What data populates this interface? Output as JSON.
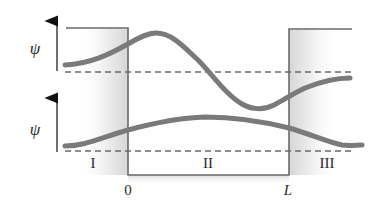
{
  "diagram": {
    "title": "",
    "colors": {
      "curve": "#7a7a7a",
      "outline": "#6a6a6a",
      "dashed": "#6a6a6a",
      "shade": "#e6e6e6",
      "text": "#2a2a2a"
    },
    "axis_labels": {
      "upper": "ψ",
      "lower": "ψ"
    },
    "regions": {
      "left": "I",
      "middle": "II",
      "right": "III"
    },
    "positions": {
      "start": "0",
      "end": "L"
    },
    "panels": [
      {
        "name": "upper",
        "label": "ψ",
        "curve": "oscillating wave with peak in region II and trough near x=L, decaying outside"
      },
      {
        "name": "lower",
        "label": "ψ",
        "curve": "broad single hump across region II, decaying in regions I and III"
      }
    ]
  }
}
